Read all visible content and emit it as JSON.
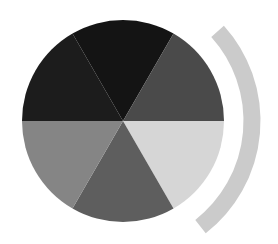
{
  "chart_data": {
    "type": "pie",
    "title": "",
    "categories": [
      "Slice 1",
      "Slice 2",
      "Slice 3",
      "Slice 4",
      "Slice 5",
      "Slice 6"
    ],
    "values": [
      1,
      1,
      1,
      1,
      1,
      1
    ],
    "percentages": [
      16.7,
      16.7,
      16.7,
      16.7,
      16.7,
      16.7
    ],
    "slice_angles_deg": [
      60,
      60,
      60,
      60,
      60,
      60
    ],
    "legend": [],
    "labels_shown": false,
    "colors": [
      "#141414",
      "#4a4a4a",
      "#d6d6d6",
      "#5e5e5e",
      "#858585",
      "#1c1c1c"
    ],
    "slice_order_note": "clockwise starting from top slice (240deg to 300deg in screen angle)",
    "arc_decoration": {
      "color": "#cbcbcb",
      "position": "right",
      "thickness_px": 17
    }
  },
  "geometry": {
    "cx": 123,
    "cy": 121,
    "r": 101,
    "start_angle_deg": 240,
    "arc": {
      "cx": 118,
      "cy": 121,
      "r": 134,
      "start_deg": -42,
      "end_deg": 52
    }
  }
}
